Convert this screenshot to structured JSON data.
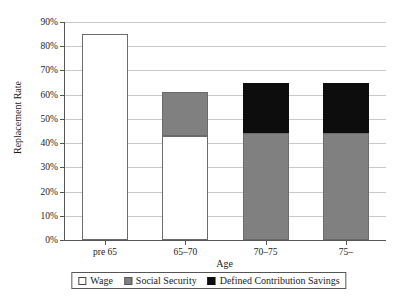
{
  "chart_data": {
    "type": "bar",
    "stacked": true,
    "title": "",
    "xlabel": "Age",
    "ylabel": "Replacement Rate",
    "categories": [
      "pre 65",
      "65–70",
      "70–75",
      "75–"
    ],
    "ylim": [
      0,
      90
    ],
    "ytick_labels": [
      "0%",
      "10%",
      "20%",
      "30%",
      "40%",
      "50%",
      "60%",
      "70%",
      "80%",
      "90%"
    ],
    "ytick_values": [
      0,
      10,
      20,
      30,
      40,
      50,
      60,
      70,
      80,
      90
    ],
    "grid": true,
    "legend_position": "bottom",
    "series": [
      {
        "name": "Wage",
        "color": "#ffffff",
        "values": [
          85,
          43,
          0,
          0
        ]
      },
      {
        "name": "Social Security",
        "color": "#808080",
        "values": [
          0,
          18,
          44,
          44
        ]
      },
      {
        "name": "Defined Contribution Savings",
        "color": "#0d0d0d",
        "values": [
          0,
          0,
          21,
          21
        ]
      }
    ],
    "totals": [
      85,
      61,
      65,
      65
    ]
  },
  "legend": {
    "items": [
      {
        "label": "Wage"
      },
      {
        "label": "Social Security"
      },
      {
        "label": "Defined Contribution Savings"
      }
    ]
  }
}
